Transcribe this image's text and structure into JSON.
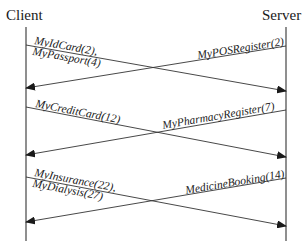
{
  "diagram": {
    "type": "sequence",
    "actors": {
      "client": {
        "label": "Client"
      },
      "server": {
        "label": "Server"
      }
    },
    "messages": [
      {
        "from": "client",
        "to": "server",
        "lines": [
          "MyIdCard(2),",
          "MyPassport(4)"
        ]
      },
      {
        "from": "server",
        "to": "client",
        "lines": [
          "MyPOSRegister(2)"
        ]
      },
      {
        "from": "client",
        "to": "server",
        "lines": [
          "MyCreditCard(12)"
        ]
      },
      {
        "from": "server",
        "to": "client",
        "lines": [
          "MyPharmacyRegister(7)"
        ]
      },
      {
        "from": "client",
        "to": "server",
        "lines": [
          "MyInsurance(22),",
          "MyDialysis(27)"
        ]
      },
      {
        "from": "server",
        "to": "client",
        "lines": [
          "MedicineBooking(14)"
        ]
      }
    ]
  }
}
